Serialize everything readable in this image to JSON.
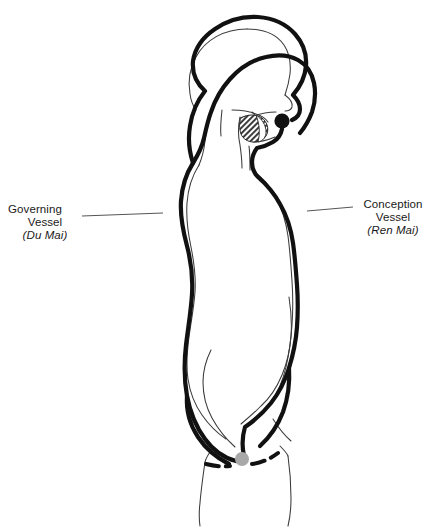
{
  "figure": {
    "background_color": "#ffffff",
    "meridian_color": "#111111",
    "body_contour_color": "#3a3a3a",
    "leader_line_color": "#555555",
    "perineum_point_color": "#a8a8a8",
    "mouth_point_color": "#111111",
    "mouth_cavity_fill": "#4a4a4a"
  },
  "labels": {
    "left": {
      "name": "governing-vessel",
      "line1": "Governing",
      "line2": "Vessel",
      "line3": "(Du Mai)"
    },
    "right": {
      "name": "conception-vessel",
      "line1": "Conception",
      "line2": "Vessel",
      "line3": "(Ren Mai)"
    }
  },
  "points": {
    "mouth": {
      "label": "mouth-junction-point",
      "x": 282,
      "y": 121,
      "r": 7.5,
      "color": "#111111"
    },
    "perineum": {
      "label": "perineum-junction-point",
      "x": 242,
      "y": 459,
      "r": 7.0,
      "color": "#a8a8a8"
    }
  },
  "leader_lines": {
    "left": {
      "x1": 82,
      "y1": 216,
      "x2": 163,
      "y2": 213
    },
    "right": {
      "x1": 307,
      "y1": 211,
      "x2": 352,
      "y2": 207
    }
  }
}
